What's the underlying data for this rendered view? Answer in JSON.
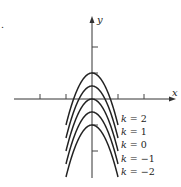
{
  "chart_data": {
    "type": "line",
    "title": "",
    "xlabel": "x",
    "ylabel": "y",
    "function": "y = k - x^2",
    "x": [
      -2,
      -1.5,
      -1,
      -0.5,
      0,
      0.5,
      1,
      1.5,
      2
    ],
    "series": [
      {
        "name": "k = 2",
        "k": 2,
        "values": [
          -2,
          -0.25,
          1,
          1.75,
          2,
          1.75,
          1,
          -0.25,
          -2
        ]
      },
      {
        "name": "k = 1",
        "k": 1,
        "values": [
          -3,
          -1.25,
          0,
          0.75,
          1,
          0.75,
          0,
          -1.25,
          -3
        ]
      },
      {
        "name": "k = 0",
        "k": 0,
        "values": [
          -4,
          -2.25,
          -1,
          -0.25,
          0,
          -0.25,
          -1,
          -2.25,
          -4
        ]
      },
      {
        "name": "k = −1",
        "k": -1,
        "values": [
          -5,
          -3.25,
          -2,
          -1.25,
          -1,
          -1.25,
          -2,
          -3.25,
          -5
        ]
      },
      {
        "name": "k = −2",
        "k": -2,
        "values": [
          -6,
          -4.25,
          -3,
          -2.25,
          -2,
          -2.25,
          -3,
          -4.25,
          -6
        ]
      }
    ],
    "xlim": [
      -6,
      6.5
    ],
    "ylim": [
      -6.5,
      6.3
    ],
    "x_ticks": [
      -4,
      -2,
      2,
      4
    ],
    "y_ticks": [
      -4,
      -2,
      2,
      4
    ],
    "tick_labels_shown": false,
    "grid": false,
    "legend": "curve labels at right ends"
  },
  "labels": {
    "x_axis": "x",
    "y_axis": "y",
    "curves": [
      "k = 2",
      "k = 1",
      "k = 0",
      "k = −1",
      "k = −2"
    ],
    "part_marker": "."
  }
}
